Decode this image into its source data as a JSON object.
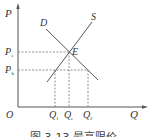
{
  "diagram": {
    "type": "supply-demand",
    "axes": {
      "y_label": "P",
      "x_label": "Q",
      "origin_label": "O"
    },
    "curves": [
      {
        "name": "D",
        "label": "D"
      },
      {
        "name": "S",
        "label": "S"
      }
    ],
    "equilibrium": {
      "label": "E"
    },
    "price_levels": [
      {
        "label": "P",
        "sub": "e"
      },
      {
        "label": "P",
        "sub": "h"
      }
    ],
    "quantity_levels": [
      {
        "label": "Q",
        "sub": "1"
      },
      {
        "label": "Q",
        "sub": "e"
      },
      {
        "label": "Q",
        "sub": "2"
      }
    ],
    "caption": "图 3-13  最高限价"
  },
  "colors": {
    "line": "#555555",
    "dashed": "#777777",
    "text": "#333333"
  }
}
